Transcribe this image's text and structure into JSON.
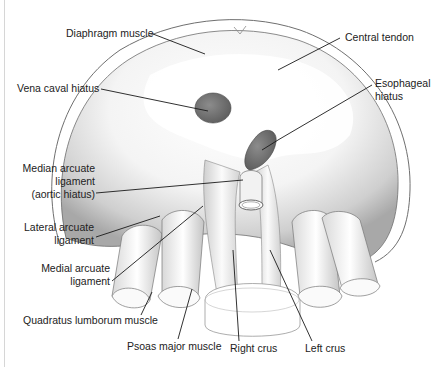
{
  "figure": {
    "colors": {
      "background": "#ffffff",
      "outline": "#6f6f6f",
      "muscle_shade": "#bdbdbd",
      "hiatus_fill": "#7a7a7a",
      "leader_line": "#1a1a1a",
      "label_text": "#222222"
    }
  },
  "labels": {
    "diaphragm_muscle": "Diaphragm muscle",
    "central_tendon": "Central tendon",
    "vena_caval_hiatus": "Vena caval hiatus",
    "esophageal_hiatus": "Esophageal\nhiatus",
    "median_arcuate_ligament": "Median arcuate\nligament\n(aortic hiatus)",
    "lateral_arcuate_ligament": "Lateral arcuate\nligament",
    "medial_arcuate_ligament": "Medial arcuate\nligament",
    "quadratus_lumborum_muscle": "Quadratus lumborum muscle",
    "psoas_major_muscle": "Psoas major muscle",
    "right_crus": "Right crus",
    "left_crus": "Left crus"
  }
}
